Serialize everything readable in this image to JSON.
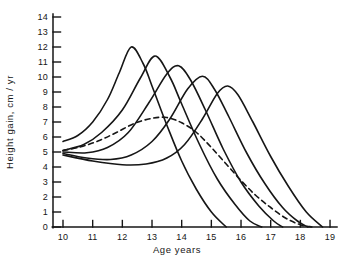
{
  "figure": {
    "background": "#ffffff",
    "ink_color": "#161616",
    "kind": "scanned line chart, black ink on white"
  },
  "chart_data": {
    "type": "line",
    "title": "",
    "xlabel": "Age years",
    "ylabel": "Height gain, cm / yr",
    "xlim": [
      10,
      19
    ],
    "ylim": [
      0,
      14
    ],
    "x_ticks": [
      10,
      11,
      12,
      13,
      14,
      15,
      16,
      17,
      18,
      19
    ],
    "y_ticks": [
      0,
      1,
      2,
      3,
      4,
      5,
      6,
      7,
      8,
      9,
      10,
      11,
      12,
      13,
      14
    ],
    "grid": false,
    "legend": "none",
    "series": [
      {
        "name": "individual-1-earliest-peak",
        "style": "solid",
        "peak": {
          "age": 12.3,
          "value": 12.0
        },
        "points": [
          [
            10,
            5.7
          ],
          [
            10.5,
            6.1
          ],
          [
            11,
            7.0
          ],
          [
            11.5,
            8.5
          ],
          [
            11.9,
            10.3
          ],
          [
            12.3,
            12.0
          ],
          [
            12.7,
            10.9
          ],
          [
            13,
            9.4
          ],
          [
            13.5,
            6.8
          ],
          [
            14,
            4.4
          ],
          [
            14.5,
            2.5
          ],
          [
            15,
            1.0
          ],
          [
            15.5,
            0
          ]
        ]
      },
      {
        "name": "individual-2",
        "style": "solid",
        "peak": {
          "age": 13.1,
          "value": 11.4
        },
        "points": [
          [
            10,
            5.1
          ],
          [
            10.7,
            5.5
          ],
          [
            11.3,
            6.3
          ],
          [
            12,
            7.8
          ],
          [
            12.6,
            9.9
          ],
          [
            13.1,
            11.4
          ],
          [
            13.6,
            10.0
          ],
          [
            14,
            8.2
          ],
          [
            14.6,
            5.5
          ],
          [
            15.2,
            3.2
          ],
          [
            15.8,
            1.5
          ],
          [
            16.3,
            0.4
          ],
          [
            16.7,
            0
          ]
        ]
      },
      {
        "name": "individual-3",
        "style": "solid",
        "peak": {
          "age": 13.9,
          "value": 10.75
        },
        "points": [
          [
            10,
            5.0
          ],
          [
            10.8,
            4.95
          ],
          [
            11.5,
            5.3
          ],
          [
            12.2,
            6.3
          ],
          [
            12.9,
            8.3
          ],
          [
            13.5,
            10.2
          ],
          [
            13.9,
            10.75
          ],
          [
            14.3,
            9.8
          ],
          [
            14.8,
            7.8
          ],
          [
            15.4,
            5.2
          ],
          [
            16,
            3.0
          ],
          [
            16.6,
            1.4
          ],
          [
            17.1,
            0.4
          ],
          [
            17.4,
            0
          ]
        ]
      },
      {
        "name": "individual-4",
        "style": "solid",
        "peak": {
          "age": 14.7,
          "value": 10.05
        },
        "points": [
          [
            10,
            4.9
          ],
          [
            10.8,
            4.6
          ],
          [
            11.6,
            4.5
          ],
          [
            12.3,
            4.8
          ],
          [
            13,
            5.7
          ],
          [
            13.6,
            7.2
          ],
          [
            14.2,
            9.2
          ],
          [
            14.7,
            10.05
          ],
          [
            15.1,
            9.2
          ],
          [
            15.6,
            7.3
          ],
          [
            16.2,
            4.9
          ],
          [
            16.8,
            2.9
          ],
          [
            17.4,
            1.3
          ],
          [
            17.9,
            0.4
          ],
          [
            18.25,
            0
          ]
        ]
      },
      {
        "name": "individual-5-latest-peak",
        "style": "solid",
        "peak": {
          "age": 15.55,
          "value": 9.4
        },
        "points": [
          [
            10,
            4.8
          ],
          [
            11,
            4.4
          ],
          [
            12,
            4.15
          ],
          [
            12.8,
            4.2
          ],
          [
            13.5,
            4.6
          ],
          [
            14.1,
            5.5
          ],
          [
            14.7,
            7.2
          ],
          [
            15.2,
            8.9
          ],
          [
            15.55,
            9.4
          ],
          [
            15.9,
            8.8
          ],
          [
            16.4,
            7.0
          ],
          [
            17,
            4.7
          ],
          [
            17.6,
            2.7
          ],
          [
            18.2,
            1.0
          ],
          [
            18.75,
            0
          ]
        ]
      },
      {
        "name": "mean-curve",
        "style": "dashed",
        "peak": {
          "age": 13.3,
          "value": 7.3
        },
        "points": [
          [
            10,
            5.1
          ],
          [
            10.6,
            5.35
          ],
          [
            11.2,
            5.75
          ],
          [
            11.8,
            6.3
          ],
          [
            12.4,
            6.9
          ],
          [
            13,
            7.25
          ],
          [
            13.5,
            7.3
          ],
          [
            14,
            6.95
          ],
          [
            14.5,
            6.3
          ],
          [
            15,
            5.3
          ],
          [
            15.5,
            4.2
          ],
          [
            16,
            3.1
          ],
          [
            16.5,
            2.1
          ],
          [
            17,
            1.3
          ],
          [
            17.5,
            0.6
          ],
          [
            18,
            0.15
          ],
          [
            18.4,
            0
          ]
        ]
      }
    ]
  }
}
